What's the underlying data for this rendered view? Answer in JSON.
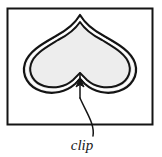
{
  "figure": {
    "name": "clip-region-diagram",
    "background_color": "#ffffff",
    "frame": {
      "name": "outer-frame",
      "stroke_color": "#141414",
      "fill_color": "#ffffff",
      "x": 7,
      "y": 8,
      "width": 146,
      "height": 117
    },
    "shape": {
      "name": "inverted-heart-clip-shape",
      "description": "inverted heart / spade outline with double contour",
      "fill_color": "#ededed",
      "outer_stroke_color": "#141414",
      "inner_stroke_color": "#141414",
      "band_color": "#ffffff",
      "top_point": {
        "x": 80,
        "y": 16
      },
      "left_extent": 23,
      "right_extent": 137,
      "bottom_notch": {
        "x": 80,
        "y": 88
      },
      "bottom_extent": 96
    },
    "annotation": {
      "name": "clip-callout",
      "label": "clip",
      "label_x": 82,
      "label_y": 149,
      "leader_color": "#141414",
      "arrow_tip": {
        "x": 80,
        "y": 90
      },
      "arrow_tail": {
        "x": 92,
        "y": 136
      }
    }
  }
}
